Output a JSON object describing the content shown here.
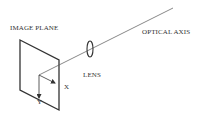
{
  "diagram": {
    "labels": {
      "image_plane": "IMAGE PLANE",
      "optical_axis": "OPTICAL AXIS",
      "lens": "LENS",
      "x_axis": "X",
      "y_axis": "Y"
    },
    "colors": {
      "stroke": "#333333",
      "background": "#ffffff"
    }
  }
}
